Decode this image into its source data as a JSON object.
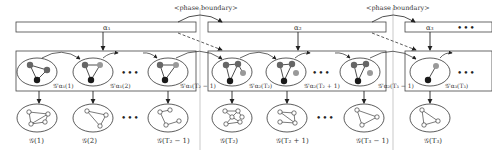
{
  "phase_boundary_label": "<phase boundary>",
  "phases": [
    {
      "label": "α₁"
    },
    {
      "label": "α₂"
    },
    {
      "label": "α₃"
    }
  ],
  "latent_labels": [
    "𝒢'α₁(1)",
    "𝒢'α₁(2)",
    "𝒢'α₁(T₂ − 1)",
    "𝒢'α₂(T₂)",
    "𝒢'α₂(T₂ + 1)",
    "𝒢'α₂(T₃ − 1)",
    "𝒢'α₃(T₃)"
  ],
  "observed_labels": [
    "𝒢(1)",
    "𝒢(2)",
    "𝒢(T₂ − 1)",
    "𝒢(T₂)",
    "𝒢(T₂ + 1)",
    "𝒢(T₃ − 1)",
    "𝒢(T₃)"
  ],
  "ellipsis": "•••",
  "colors": {
    "stroke": "#333333",
    "node_dark": "#1a1a1a",
    "node_gray": "#666666",
    "node_light": "#999999",
    "divider": "#bbbbbb"
  }
}
